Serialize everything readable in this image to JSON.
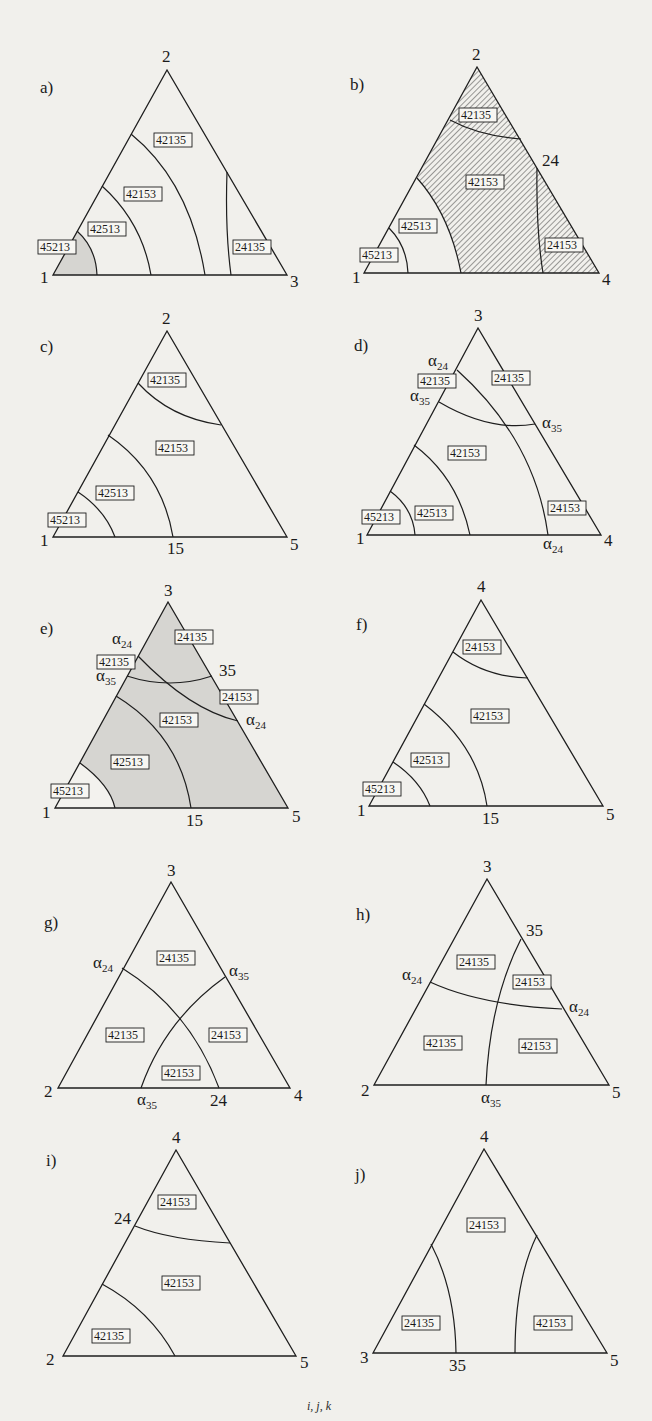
{
  "figure": {
    "bottom_caption": "i, j, k",
    "colors": {
      "paper": "#f1f0ec",
      "line": "#1e1e1e",
      "shade": "#d6d5d1",
      "hatch": "#2a2a2a"
    }
  },
  "panels": [
    {
      "id": "a",
      "label": "a)",
      "vertices": {
        "top": "2",
        "left": "1",
        "right": "3"
      },
      "edge_marks": [],
      "regions": [
        "45213",
        "42513",
        "42153",
        "42135",
        "24135"
      ],
      "shading": "grey fill on 45213 region"
    },
    {
      "id": "b",
      "label": "b)",
      "vertices": {
        "top": "2",
        "left": "1",
        "right": "4"
      },
      "edge_marks": [
        "24"
      ],
      "regions": [
        "42135",
        "42153",
        "42513",
        "45213",
        "24153"
      ],
      "shading": "hatched on 42135, 42153, 24153 regions"
    },
    {
      "id": "c",
      "label": "c)",
      "vertices": {
        "top": "2",
        "left": "1",
        "right": "5"
      },
      "edge_marks": [
        "15"
      ],
      "regions": [
        "42135",
        "42153",
        "42513",
        "45213"
      ],
      "shading": "none"
    },
    {
      "id": "d",
      "label": "d)",
      "vertices": {
        "top": "3",
        "left": "1",
        "right": "4"
      },
      "edge_marks": [
        "α24 (left edge)",
        "α35 (left edge)",
        "α35 (right edge)",
        "α24 (bottom edge)"
      ],
      "regions": [
        "42135",
        "24135",
        "42153",
        "24153",
        "42513",
        "45213"
      ],
      "shading": "none"
    },
    {
      "id": "e",
      "label": "e)",
      "vertices": {
        "top": "3",
        "left": "1",
        "right": "5"
      },
      "edge_marks": [
        "α24 (left edge)",
        "α35 (left edge)",
        "35",
        "α24 (right edge)",
        "15"
      ],
      "regions": [
        "24135",
        "42135",
        "24153",
        "42153",
        "42513",
        "45213"
      ],
      "shading": "grey fill everywhere except 45213 region"
    },
    {
      "id": "f",
      "label": "f)",
      "vertices": {
        "top": "4",
        "left": "1",
        "right": "5"
      },
      "edge_marks": [
        "15"
      ],
      "regions": [
        "24153",
        "42153",
        "42513",
        "45213"
      ],
      "shading": "none"
    },
    {
      "id": "g",
      "label": "g)",
      "vertices": {
        "top": "3",
        "left": "2",
        "right": "4"
      },
      "edge_marks": [
        "α24 (left edge)",
        "α35 (right edge)",
        "α35 (bottom edge)",
        "24"
      ],
      "regions": [
        "24135",
        "42135",
        "24153",
        "42153"
      ],
      "shading": "none"
    },
    {
      "id": "h",
      "label": "h)",
      "vertices": {
        "top": "3",
        "left": "2",
        "right": "5"
      },
      "edge_marks": [
        "35",
        "α24 (left edge)",
        "α24 (right edge)",
        "α35 (bottom edge)"
      ],
      "regions": [
        "24135",
        "24153",
        "42135",
        "42153"
      ],
      "shading": "none"
    },
    {
      "id": "i",
      "label": "i)",
      "vertices": {
        "top": "4",
        "left": "2",
        "right": "5"
      },
      "edge_marks": [
        "24"
      ],
      "regions": [
        "24153",
        "42153",
        "42135"
      ],
      "shading": "none"
    },
    {
      "id": "j",
      "label": "j)",
      "vertices": {
        "top": "4",
        "left": "3",
        "right": "5"
      },
      "edge_marks": [
        "35"
      ],
      "regions": [
        "24153",
        "24135",
        "42153"
      ],
      "shading": "none"
    }
  ],
  "t": {
    "a": {
      "lbl": "a)",
      "v2": "2",
      "v1": "1",
      "v3": "3",
      "r1": "42135",
      "r2": "42153",
      "r3": "42513",
      "r4": "45213",
      "r5": "24135"
    },
    "b": {
      "lbl": "b)",
      "v2": "2",
      "v1": "1",
      "v4": "4",
      "m24": "24",
      "r1": "42135",
      "r2": "42153",
      "r3": "42513",
      "r4": "45213",
      "r5": "24153"
    },
    "c": {
      "lbl": "c)",
      "v2": "2",
      "v1": "1",
      "v5": "5",
      "m15": "15",
      "r1": "42135",
      "r2": "42153",
      "r3": "42513",
      "r4": "45213"
    },
    "d": {
      "lbl": "d)",
      "v3": "3",
      "v1": "1",
      "v4": "4",
      "r1": "42135",
      "r2": "24135",
      "r3": "42153",
      "r4": "42513",
      "r5": "45213",
      "r6": "24153"
    },
    "e": {
      "lbl": "e)",
      "v3": "3",
      "v1": "1",
      "v5": "5",
      "m35": "35",
      "m15": "15",
      "r1": "24135",
      "r2": "42135",
      "r3": "24153",
      "r4": "42153",
      "r5": "42513",
      "r6": "45213"
    },
    "f": {
      "lbl": "f)",
      "v4": "4",
      "v1": "1",
      "v5": "5",
      "m15": "15",
      "r1": "24153",
      "r2": "42153",
      "r3": "42513",
      "r4": "45213"
    },
    "g": {
      "lbl": "g)",
      "v3": "3",
      "v2": "2",
      "v4": "4",
      "m24": "24",
      "r1": "24135",
      "r2": "42135",
      "r3": "24153",
      "r4": "42153"
    },
    "h": {
      "lbl": "h)",
      "v3": "3",
      "v2": "2",
      "v5": "5",
      "m35": "35",
      "r1": "24135",
      "r2": "24153",
      "r3": "42135",
      "r4": "42153"
    },
    "i": {
      "lbl": "i)",
      "v4": "4",
      "v2": "2",
      "v5": "5",
      "m24": "24",
      "r1": "24153",
      "r2": "42153",
      "r3": "42135"
    },
    "j": {
      "lbl": "j)",
      "v4": "4",
      "v3": "3",
      "v5": "5",
      "m35": "35",
      "r1": "24153",
      "r2": "24135",
      "r3": "42153"
    },
    "alpha": "α",
    "sub24": "24",
    "sub35": "35"
  }
}
